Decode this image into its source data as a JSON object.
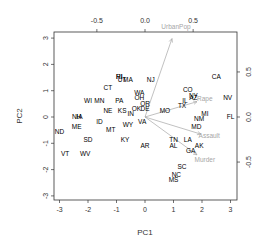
{
  "chart_data": {
    "type": "scatter",
    "subtype": "biplot",
    "title": "",
    "xlabel": "PC1",
    "ylabel": "PC2",
    "xlim": [
      -3.2,
      3.2
    ],
    "ylim": [
      -3.2,
      3.2
    ],
    "x_ticks": [
      -3,
      -2,
      -1,
      0,
      1,
      2,
      3
    ],
    "y_ticks": [
      -3,
      -2,
      -1,
      0,
      1,
      2,
      3
    ],
    "top_ticks": [
      -0.5,
      0.0,
      0.5
    ],
    "right_ticks": [
      -0.5,
      0.0,
      0.5
    ],
    "grid": false,
    "legend": null,
    "points": [
      {
        "label": "CA",
        "x": 2.5,
        "y": 1.5
      },
      {
        "label": "NV",
        "x": 2.9,
        "y": 0.7
      },
      {
        "label": "FL",
        "x": 3.0,
        "y": 0.0
      },
      {
        "label": "CO",
        "x": 1.5,
        "y": 1.0
      },
      {
        "label": "NY",
        "x": 1.7,
        "y": 0.8
      },
      {
        "label": "AZ",
        "x": 1.7,
        "y": 0.7
      },
      {
        "label": "IL",
        "x": 1.4,
        "y": 0.6
      },
      {
        "label": "TX",
        "x": 1.3,
        "y": 0.4
      },
      {
        "label": "MI",
        "x": 2.1,
        "y": 0.1
      },
      {
        "label": "NM",
        "x": 1.9,
        "y": -0.1
      },
      {
        "label": "MD",
        "x": 1.8,
        "y": -0.4
      },
      {
        "label": "LA",
        "x": 1.5,
        "y": -0.9
      },
      {
        "label": "AK",
        "x": 1.9,
        "y": -1.1
      },
      {
        "label": "GA",
        "x": 1.6,
        "y": -1.3
      },
      {
        "label": "TN",
        "x": 1.0,
        "y": -0.9
      },
      {
        "label": "AL",
        "x": 1.0,
        "y": -1.1
      },
      {
        "label": "SC",
        "x": 1.3,
        "y": -1.9
      },
      {
        "label": "NC",
        "x": 1.1,
        "y": -2.2
      },
      {
        "label": "MS",
        "x": 1.0,
        "y": -2.4
      },
      {
        "label": "MO",
        "x": 0.7,
        "y": 0.2
      },
      {
        "label": "NJ",
        "x": 0.2,
        "y": 1.4
      },
      {
        "label": "RI",
        "x": -0.9,
        "y": 1.5
      },
      {
        "label": "HI",
        "x": -0.9,
        "y": 1.5
      },
      {
        "label": "MA",
        "x": -0.6,
        "y": 1.4
      },
      {
        "label": "UT",
        "x": -0.8,
        "y": 1.4
      },
      {
        "label": "WA",
        "x": -0.2,
        "y": 0.9
      },
      {
        "label": "OH",
        "x": -0.2,
        "y": 0.7
      },
      {
        "label": "OR",
        "x": 0.0,
        "y": 0.5
      },
      {
        "label": "DE",
        "x": 0.0,
        "y": 0.3
      },
      {
        "label": "OK",
        "x": -0.3,
        "y": 0.3
      },
      {
        "label": "IN",
        "x": -0.5,
        "y": 0.1
      },
      {
        "label": "KS",
        "x": -0.8,
        "y": 0.2
      },
      {
        "label": "PA",
        "x": -0.9,
        "y": 0.6
      },
      {
        "label": "VA",
        "x": -0.1,
        "y": -0.2
      },
      {
        "label": "WY",
        "x": -0.6,
        "y": -0.3
      },
      {
        "label": "CT",
        "x": -1.3,
        "y": 1.1
      },
      {
        "label": "MN",
        "x": -1.6,
        "y": 0.6
      },
      {
        "label": "WI",
        "x": -2.0,
        "y": 0.6
      },
      {
        "label": "NE",
        "x": -1.3,
        "y": 0.2
      },
      {
        "label": "ID",
        "x": -1.6,
        "y": -0.2
      },
      {
        "label": "MT",
        "x": -1.2,
        "y": -0.5
      },
      {
        "label": "KY",
        "x": -0.7,
        "y": -0.9
      },
      {
        "label": "AR",
        "x": 0.0,
        "y": -1.1
      },
      {
        "label": "IA",
        "x": -2.3,
        "y": 0.0
      },
      {
        "label": "NH",
        "x": -2.4,
        "y": 0.0
      },
      {
        "label": "ME",
        "x": -2.4,
        "y": -0.4
      },
      {
        "label": "SD",
        "x": -2.0,
        "y": -0.9
      },
      {
        "label": "ND",
        "x": -3.0,
        "y": -0.6
      },
      {
        "label": "VT",
        "x": -2.8,
        "y": -1.4
      },
      {
        "label": "WV",
        "x": -2.1,
        "y": -1.4
      }
    ],
    "loadings": [
      {
        "label": "UrbanPop",
        "pc1": 0.28,
        "pc2": 0.87
      },
      {
        "label": "Rape",
        "pc1": 0.54,
        "pc2": 0.17
      },
      {
        "label": "Assault",
        "pc1": 0.58,
        "pc2": -0.19
      },
      {
        "label": "Murder",
        "pc1": 0.54,
        "pc2": -0.42
      }
    ],
    "colors": {
      "points": "#000000",
      "arrows": "#a6a6a6",
      "axes": "#333333"
    }
  }
}
